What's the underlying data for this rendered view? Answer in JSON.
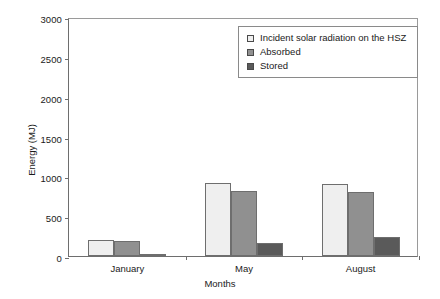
{
  "chart_data": {
    "type": "bar",
    "title": "",
    "xlabel": "Months",
    "ylabel": "Energy (MJ)",
    "categories": [
      "January",
      "May",
      "August"
    ],
    "series": [
      {
        "name": "Incident solar radiation on the HSZ",
        "values": [
          200,
          920,
          910
        ],
        "color": "#efefef"
      },
      {
        "name": "Absorbed",
        "values": [
          190,
          810,
          800
        ],
        "color": "#909090"
      },
      {
        "name": "Stored",
        "values": [
          25,
          165,
          240
        ],
        "color": "#5a5a5a"
      }
    ],
    "ylim": [
      0,
      3000
    ],
    "yticks": [
      0,
      500,
      1000,
      1500,
      2000,
      2500,
      3000
    ],
    "ytick_labels": [
      "0",
      "500",
      "1000",
      "1500",
      "2000",
      "2500",
      "3000"
    ],
    "grid": false,
    "legend_position": "top-right"
  }
}
